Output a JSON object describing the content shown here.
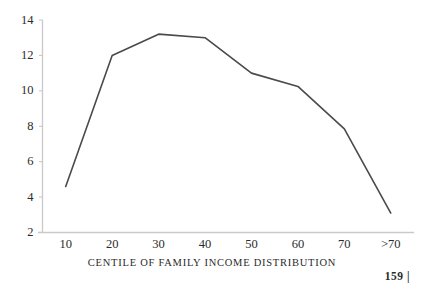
{
  "page": {
    "background_color": "#ffffff",
    "page_number": "159  |"
  },
  "chart_data": {
    "type": "line",
    "title": "",
    "xlabel": "CENTILE OF FAMILY INCOME DISTRIBUTION",
    "ylabel": "",
    "categories": [
      "10",
      "20",
      "30",
      "40",
      "50",
      "60",
      "70",
      ">70"
    ],
    "x": [
      10,
      20,
      30,
      40,
      50,
      60,
      70,
      80
    ],
    "values": [
      4.6,
      12.0,
      13.2,
      13.0,
      11.0,
      10.25,
      7.85,
      3.1
    ],
    "series": [
      {
        "name": "centile-series",
        "values": [
          4.6,
          12.0,
          13.2,
          13.0,
          11.0,
          10.25,
          7.85,
          3.1
        ],
        "color": "#4a4a4a"
      }
    ],
    "xlim": [
      5,
      85
    ],
    "ylim": [
      2,
      14
    ],
    "ytick_labels": [
      "14",
      "12",
      "10",
      "8",
      "6",
      "4",
      "2"
    ],
    "ytick_values": [
      14,
      12,
      10,
      8,
      6,
      4,
      2
    ],
    "xtick_labels": [
      "10",
      "20",
      "30",
      "40",
      "50",
      "60",
      "70",
      ">70"
    ],
    "grid": false,
    "legend": "none",
    "line_color": "#4a4a4a",
    "axis_color": "#c9c9c9",
    "line_width": 1.6,
    "markers": false
  }
}
